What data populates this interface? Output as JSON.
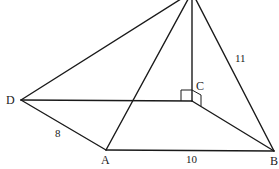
{
  "diagram": {
    "vertices": {
      "A": "A",
      "B": "B",
      "C": "C",
      "D": "D"
    },
    "edges": [
      {
        "from": "P",
        "to": "D"
      },
      {
        "from": "P",
        "to": "A"
      },
      {
        "from": "P",
        "to": "C"
      },
      {
        "from": "P",
        "to": "B"
      },
      {
        "from": "D",
        "to": "C"
      },
      {
        "from": "C",
        "to": "B"
      },
      {
        "from": "D",
        "to": "A"
      },
      {
        "from": "A",
        "to": "B"
      }
    ],
    "lengths": {
      "DA": "8",
      "AB": "10",
      "PB": "11"
    },
    "right_angle_marker": "C"
  }
}
